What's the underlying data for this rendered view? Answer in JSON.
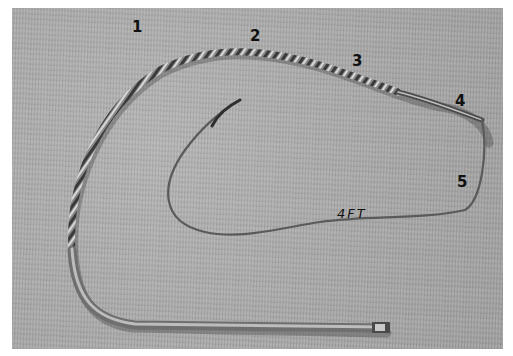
{
  "image": {
    "description": "Photograph of a braided bullwhip laid out in a loop on grey carpet, with numbered section labels",
    "background_color": "#a9a9a9",
    "border_color": "#ffffff"
  },
  "labels": [
    {
      "id": "1",
      "text": "1",
      "x": 120,
      "y": 18
    },
    {
      "id": "2",
      "text": "2",
      "x": 250,
      "y": 28
    },
    {
      "id": "3",
      "text": "3",
      "x": 352,
      "y": 52
    },
    {
      "id": "4",
      "text": "4",
      "x": 456,
      "y": 92
    },
    {
      "id": "5",
      "text": "5",
      "x": 457,
      "y": 172
    }
  ],
  "annotation": {
    "text": "4FT"
  }
}
